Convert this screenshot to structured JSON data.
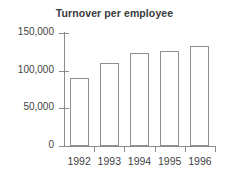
{
  "chart_data": {
    "type": "bar",
    "title": "Turnover per employee",
    "xlabel": "",
    "ylabel": "",
    "categories": [
      "1992",
      "1993",
      "1994",
      "1995",
      "1996"
    ],
    "values": [
      90000,
      110000,
      123000,
      126000,
      133000
    ],
    "ylim": [
      0,
      150000
    ],
    "yticks": [
      0,
      50000,
      100000,
      150000
    ],
    "ytick_labels": [
      "0",
      "50,000",
      "100,000",
      "150,000"
    ],
    "grid": false,
    "legend": false,
    "bar_fill_color": "#ffffff",
    "bar_edge_color": "#8f8f8f",
    "axis_color": "#8c8c8c",
    "text_color": "#3f3f3f",
    "title_color": "#3a3a3a",
    "background_color": "#ffffff"
  }
}
